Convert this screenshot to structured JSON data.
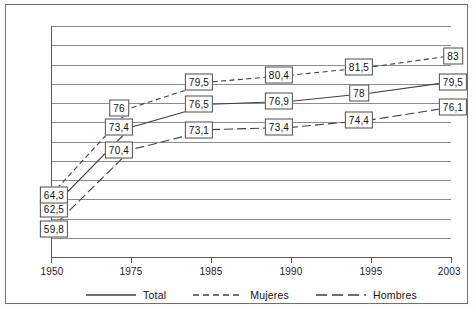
{
  "chart_data": {
    "type": "line",
    "title": "",
    "subtitle": "",
    "xlabel": "",
    "ylabel": "",
    "categories": [
      "1950",
      "1975",
      "1985",
      "1990",
      "1995",
      "2003"
    ],
    "ylim": [
      56.0,
      87.0
    ],
    "grid": true,
    "gridline_count": 12,
    "legend_position": "bottom",
    "series": [
      {
        "name": "Total",
        "style": "solid",
        "color": "#3f3f3f",
        "values": [
          62.5,
          73.4,
          76.5,
          76.9,
          78.0,
          79.5
        ],
        "labels": [
          "62,5",
          "73,4",
          "76,5",
          "76,9",
          "78",
          "79,5"
        ]
      },
      {
        "name": "Mujeres",
        "style": "dashed",
        "color": "#3f3f3f",
        "values": [
          64.3,
          76.0,
          79.5,
          80.4,
          81.5,
          83.0
        ],
        "labels": [
          "64,3",
          "76",
          "79,5",
          "80,4",
          "81,5",
          "83"
        ]
      },
      {
        "name": "Hombres",
        "style": "dash-dash",
        "color": "#3f3f3f",
        "values": [
          59.8,
          70.4,
          73.1,
          73.4,
          74.4,
          76.1
        ],
        "labels": [
          "59,8",
          "70,4",
          "73,1",
          "73,4",
          "74,4",
          "76,1"
        ]
      }
    ]
  },
  "axis": {
    "tick_labels": [
      "1950",
      "1975",
      "1985",
      "1990",
      "1995",
      "2003"
    ]
  },
  "legend": {
    "items": [
      {
        "label": "Total",
        "key": "solid-line-key"
      },
      {
        "label": "Mujeres",
        "key": "dashed-line-key"
      },
      {
        "label": "Hombres",
        "key": "dash-dash-line-key"
      }
    ]
  }
}
